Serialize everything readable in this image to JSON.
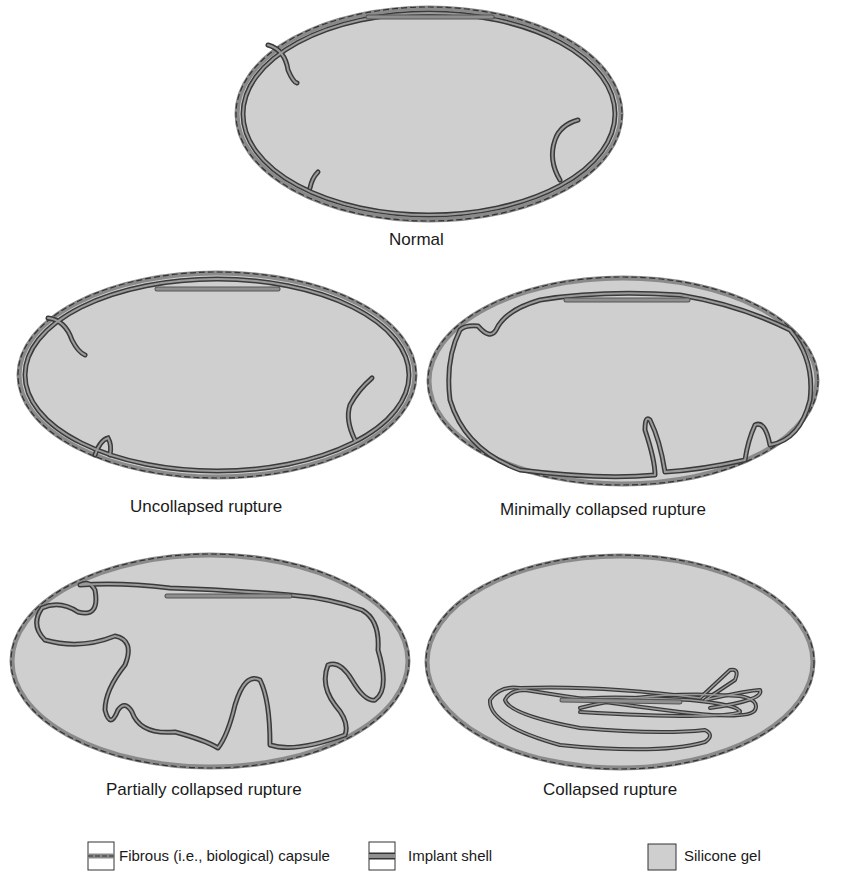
{
  "figure": {
    "panels": [
      {
        "id": "normal",
        "caption": "Normal"
      },
      {
        "id": "uncollapsed",
        "caption": "Uncollapsed rupture"
      },
      {
        "id": "minimally",
        "caption": "Minimally collapsed rupture"
      },
      {
        "id": "partially",
        "caption": "Partially collapsed rupture"
      },
      {
        "id": "collapsed",
        "caption": "Collapsed rupture"
      }
    ],
    "legend": [
      {
        "icon": "dashed-capsule-icon",
        "label": "Fibrous (i.e., biological) capsule"
      },
      {
        "icon": "implant-shell-icon",
        "label": "Implant shell"
      },
      {
        "icon": "silicone-gel-swatch",
        "label": "Silicone gel"
      }
    ],
    "colors": {
      "gel_fill": "#cfcfcf",
      "capsule_fill": "#8a8a8a",
      "capsule_dash": "#333333",
      "shell_outline": "#3a3a3a",
      "shell_inner": "#8f8f8f",
      "text": "#1a1a1a"
    }
  }
}
